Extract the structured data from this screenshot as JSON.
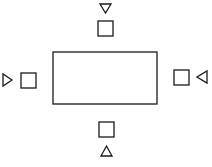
{
  "diagram": {
    "stroke_color": "#1a1a1a",
    "background": "#ffffff",
    "table": {
      "x": 53,
      "y": 52,
      "width": 104,
      "height": 52
    },
    "seats": [
      {
        "id": "top",
        "square": {
          "x": 98,
          "y": 21,
          "size": 15
        },
        "marker": {
          "direction": "down",
          "points": "100,4 111,4 105.5,13"
        }
      },
      {
        "id": "left",
        "square": {
          "x": 21,
          "y": 73,
          "size": 15
        },
        "marker": {
          "direction": "right",
          "points": "3,74 3,86 12,80"
        }
      },
      {
        "id": "right",
        "square": {
          "x": 174,
          "y": 70,
          "size": 15
        },
        "marker": {
          "direction": "left",
          "points": "207,71 207,83 197,77"
        }
      },
      {
        "id": "bottom",
        "square": {
          "x": 99,
          "y": 122,
          "size": 15
        },
        "marker": {
          "direction": "up",
          "points": "101,156 112,156 106.5,146"
        }
      }
    ]
  }
}
